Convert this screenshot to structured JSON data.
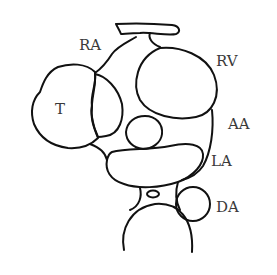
{
  "diagram": {
    "type": "anatomical-line-sketch",
    "background": "#ffffff",
    "line_color": "#111111",
    "label_color": "#3a3a3a",
    "labels": {
      "ra": "RA",
      "rv": "RV",
      "aa": "AA",
      "la": "LA",
      "da": "DA",
      "t": "T"
    }
  }
}
